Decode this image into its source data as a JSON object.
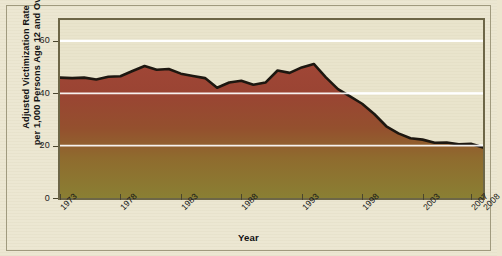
{
  "chart_data": {
    "type": "area",
    "title": "",
    "xlabel": "Year",
    "ylabel": "Adjusted Victimization Rate per 1,000 Persons Age 12 and Over",
    "ylabel_line1": "Adjusted Victimization Rate",
    "ylabel_line2": "per 1,000 Persons Age 12 and Over",
    "xlim": [
      1973,
      2008
    ],
    "ylim": [
      0,
      68
    ],
    "ytick_values": [
      0,
      20,
      40,
      60
    ],
    "ytick_labels": [
      "0",
      "20",
      "40",
      "60"
    ],
    "xtick_values": [
      1973,
      1978,
      1983,
      1988,
      1993,
      1998,
      2003,
      2007,
      2008
    ],
    "xtick_labels": [
      "1973",
      "1978",
      "1983",
      "1988",
      "1993",
      "1998",
      "2003",
      "2007",
      "2008"
    ],
    "grid": "horizontal white gridlines at 20, 40, 60",
    "legend": "none",
    "x": [
      1973,
      1974,
      1975,
      1976,
      1977,
      1978,
      1979,
      1980,
      1981,
      1982,
      1983,
      1984,
      1985,
      1986,
      1987,
      1988,
      1989,
      1990,
      1991,
      1992,
      1993,
      1994,
      1995,
      1996,
      1997,
      1998,
      1999,
      2000,
      2001,
      2002,
      2003,
      2004,
      2005,
      2006,
      2007,
      2008
    ],
    "values": [
      46.0,
      45.8,
      46.0,
      45.3,
      46.3,
      46.5,
      48.5,
      50.4,
      49.0,
      49.3,
      47.5,
      46.6,
      45.8,
      42.1,
      44.1,
      44.8,
      43.3,
      44.1,
      48.7,
      47.8,
      49.9,
      51.2,
      46.1,
      41.6,
      38.8,
      36.0,
      32.1,
      27.4,
      24.7,
      22.8,
      22.3,
      21.1,
      21.2,
      20.5,
      20.7,
      19.3
    ],
    "values_unit": "victimizations per 1,000 persons age 12 and over",
    "series_name": "Adjusted violent victimization rate",
    "colors": {
      "curve_line": "#1d1710",
      "fill_top": "#9e4334",
      "fill_bottom": "#8c7f2f",
      "plot_background": "#e9e4cc",
      "gridline": "#ffffff",
      "plot_border": "#6d6647",
      "page_background": "#ece7d2",
      "axis_text": "#141414"
    }
  }
}
